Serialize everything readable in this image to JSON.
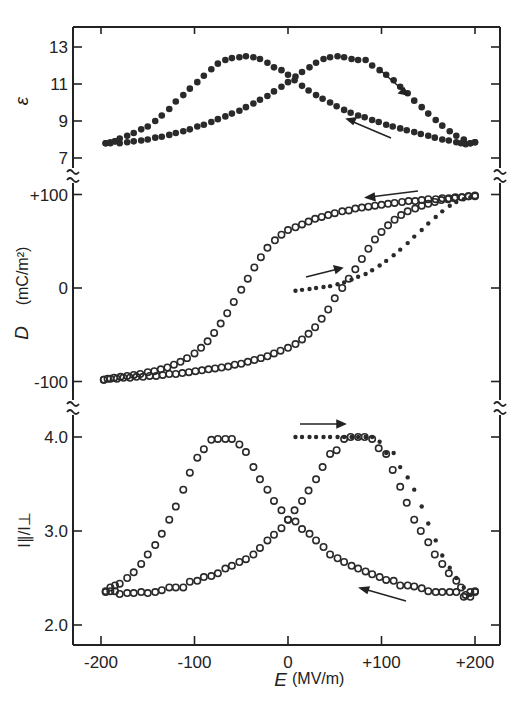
{
  "chart_data": [
    {
      "type": "scatter",
      "panel": "top",
      "title": "",
      "xlabel": "E (MV/m)",
      "ylabel": "ε",
      "xlim": [
        -200,
        200
      ],
      "ylim": [
        7,
        13
      ],
      "yticks": [
        "13",
        "11",
        "9",
        "7"
      ],
      "ytick_values": [
        13,
        11,
        9,
        7
      ],
      "marker": "filled",
      "series": [
        {
          "name": "increasing field (→)",
          "x": [
            -195,
            -190,
            -185,
            -180,
            -172,
            -165,
            -157,
            -150,
            -142,
            -135,
            -127,
            -120,
            -112,
            -105,
            -97,
            -90,
            -82,
            -75,
            -67,
            -60,
            -52,
            -45,
            -37,
            -30,
            -22,
            -15,
            -7,
            0,
            8,
            15,
            23,
            30,
            38,
            45,
            53,
            60,
            68,
            75,
            83,
            90,
            98,
            105,
            113,
            120,
            128,
            135,
            143,
            150,
            158,
            165,
            173,
            180,
            188,
            195,
            200
          ],
          "y": [
            7.8,
            7.8,
            7.9,
            7.8,
            7.85,
            7.9,
            7.95,
            8.0,
            8.1,
            8.15,
            8.25,
            8.35,
            8.45,
            8.55,
            8.7,
            8.8,
            8.95,
            9.1,
            9.25,
            9.4,
            9.55,
            9.75,
            9.95,
            10.15,
            10.35,
            10.6,
            10.85,
            11.1,
            11.4,
            11.65,
            11.9,
            12.15,
            12.35,
            12.45,
            12.5,
            12.45,
            12.35,
            12.3,
            12.3,
            12.0,
            11.75,
            11.5,
            11.2,
            10.85,
            10.5,
            10.1,
            9.75,
            9.4,
            9.05,
            8.75,
            8.45,
            8.2,
            8.0,
            7.8,
            7.85
          ]
        },
        {
          "name": "decreasing field (←)",
          "x": [
            200,
            195,
            190,
            185,
            180,
            172,
            165,
            157,
            150,
            142,
            135,
            127,
            120,
            112,
            105,
            97,
            90,
            82,
            75,
            67,
            60,
            52,
            45,
            37,
            30,
            22,
            15,
            7,
            0,
            -7,
            -15,
            -22,
            -30,
            -37,
            -45,
            -52,
            -60,
            -67,
            -75,
            -82,
            -90,
            -97,
            -105,
            -112,
            -120,
            -127,
            -135,
            -142,
            -150,
            -157,
            -165,
            -172,
            -180,
            -185,
            -190,
            -195
          ],
          "y": [
            7.85,
            7.8,
            7.75,
            7.8,
            7.85,
            7.95,
            8.0,
            8.1,
            8.2,
            8.3,
            8.4,
            8.5,
            8.6,
            8.7,
            8.8,
            8.95,
            9.05,
            9.2,
            9.3,
            9.45,
            9.6,
            9.8,
            10.0,
            10.2,
            10.4,
            10.65,
            10.9,
            11.2,
            11.5,
            11.75,
            11.9,
            12.15,
            12.35,
            12.45,
            12.5,
            12.45,
            12.4,
            12.3,
            12.1,
            11.8,
            11.45,
            11.1,
            10.75,
            10.4,
            10.05,
            9.65,
            9.3,
            9.0,
            8.7,
            8.55,
            8.35,
            8.2,
            8.05,
            7.9,
            7.85,
            7.8
          ]
        }
      ],
      "annotations": [
        "arrow → on right descending branch",
        "arrow ← on lower right branch"
      ]
    },
    {
      "type": "scatter",
      "panel": "middle",
      "title": "",
      "xlabel": "E (MV/m)",
      "ylabel": "D (mC/m²)",
      "xlim": [
        -200,
        200
      ],
      "ylim": [
        -100,
        100
      ],
      "yticks": [
        "+100",
        "0",
        "-100"
      ],
      "ytick_values": [
        100,
        0,
        -100
      ],
      "series": [
        {
          "name": "initial poling (dots)",
          "marker": "dot",
          "x": [
            8,
            15,
            23,
            30,
            38,
            45,
            53,
            60,
            68,
            75,
            83,
            90,
            98,
            105,
            113,
            120,
            128,
            135,
            143,
            150,
            158,
            165,
            173,
            180,
            188,
            195
          ],
          "y": [
            -3,
            -2,
            -1,
            0,
            1,
            2,
            4,
            6,
            9,
            12,
            15,
            19,
            24,
            29,
            35,
            41,
            48,
            55,
            62,
            69,
            76,
            82,
            88,
            92,
            95,
            97
          ]
        },
        {
          "name": "decreasing field (←)",
          "marker": "open",
          "x": [
            200,
            193,
            186,
            179,
            172,
            165,
            158,
            150,
            143,
            136,
            129,
            122,
            114,
            107,
            100,
            93,
            86,
            79,
            72,
            65,
            58,
            50,
            43,
            36,
            29,
            22,
            15,
            8,
            0,
            -7,
            -14,
            -22,
            -29,
            -36,
            -43,
            -50,
            -58,
            -65,
            -72,
            -79,
            -86,
            -93,
            -100,
            -108,
            -115,
            -122,
            -129,
            -136,
            -143,
            -150,
            -158,
            -165,
            -172,
            -179,
            -186,
            -193,
            -197
          ],
          "y": [
            98,
            98,
            97,
            97,
            96,
            96,
            95,
            95,
            94,
            93,
            93,
            92,
            91,
            90,
            89,
            88,
            87,
            86,
            85,
            83,
            82,
            80,
            78,
            76,
            74,
            71,
            68,
            65,
            62,
            57,
            51,
            43,
            33,
            22,
            10,
            -2,
            -15,
            -27,
            -38,
            -48,
            -57,
            -64,
            -70,
            -75,
            -79,
            -82,
            -85,
            -87,
            -89,
            -90,
            -92,
            -93,
            -94,
            -95,
            -96,
            -97,
            -98
          ]
        },
        {
          "name": "increasing field (→)",
          "marker": "open",
          "x": [
            -197,
            -190,
            -183,
            -176,
            -169,
            -162,
            -155,
            -148,
            -141,
            -134,
            -127,
            -120,
            -113,
            -106,
            -99,
            -92,
            -85,
            -78,
            -71,
            -64,
            -57,
            -50,
            -43,
            -36,
            -29,
            -22,
            -15,
            -8,
            0,
            8,
            15,
            22,
            29,
            36,
            43,
            50,
            58,
            65,
            72,
            79,
            86,
            93,
            100,
            107,
            114,
            121,
            128,
            136,
            143,
            150,
            157,
            164,
            171,
            178,
            186,
            193,
            200
          ],
          "y": [
            -98,
            -97,
            -97,
            -96,
            -96,
            -95,
            -95,
            -94,
            -94,
            -93,
            -92,
            -92,
            -91,
            -90,
            -89,
            -88,
            -87,
            -86,
            -85,
            -84,
            -82,
            -81,
            -79,
            -77,
            -75,
            -73,
            -70,
            -67,
            -64,
            -60,
            -55,
            -49,
            -42,
            -33,
            -23,
            -11,
            0,
            10,
            20,
            31,
            42,
            52,
            60,
            67,
            73,
            78,
            82,
            85,
            88,
            90,
            92,
            94,
            95,
            96,
            97,
            98,
            99
          ]
        }
      ],
      "annotations": [
        "arrow ← top branch",
        "arrow → near initial dotted curve"
      ]
    },
    {
      "type": "scatter",
      "panel": "bottom",
      "title": "",
      "xlabel": "E (MV/m)",
      "ylabel": "I∥/I⊥",
      "xlim": [
        -200,
        200
      ],
      "ylim": [
        2.0,
        4.0
      ],
      "xticks": [
        "-200",
        "-100",
        "0",
        "+100",
        "+200"
      ],
      "xtick_values": [
        -200,
        -100,
        0,
        100,
        200
      ],
      "yticks": [
        "4.0",
        "3.0",
        "2.0"
      ],
      "ytick_values": [
        4.0,
        3.0,
        2.0
      ],
      "series": [
        {
          "name": "initial (dots)",
          "marker": "dot",
          "x": [
            8,
            15,
            23,
            30,
            38,
            45,
            53,
            60,
            68,
            75,
            83,
            90,
            98,
            105,
            113,
            120,
            128,
            135,
            143,
            150,
            158,
            165,
            173,
            180,
            188,
            195
          ],
          "y": [
            4.0,
            4.0,
            4.0,
            4.0,
            4.0,
            4.0,
            4.0,
            4.0,
            4.0,
            4.0,
            4.0,
            4.0,
            3.95,
            3.83,
            3.83,
            3.68,
            3.57,
            3.44,
            3.26,
            3.08,
            2.9,
            2.74,
            2.61,
            2.5,
            2.4,
            2.32
          ]
        },
        {
          "name": "decreasing field (←)",
          "marker": "open",
          "x": [
            200,
            195,
            190,
            185,
            180,
            172,
            165,
            157,
            150,
            142,
            135,
            127,
            120,
            112,
            105,
            97,
            90,
            82,
            75,
            67,
            60,
            52,
            45,
            37,
            30,
            22,
            15,
            7,
            0,
            -7,
            -15,
            -22,
            -30,
            -37,
            -45,
            -52,
            -60,
            -67,
            -75,
            -82,
            -90,
            -97,
            -105,
            -112,
            -120,
            -127,
            -135,
            -142,
            -150,
            -157,
            -165,
            -172,
            -180,
            -185,
            -190,
            -195
          ],
          "y": [
            2.35,
            2.3,
            2.32,
            2.4,
            2.47,
            2.55,
            2.65,
            2.75,
            2.88,
            3.0,
            3.12,
            3.3,
            3.47,
            3.65,
            3.82,
            3.88,
            3.98,
            4.0,
            4.0,
            4.0,
            3.98,
            3.86,
            3.82,
            3.68,
            3.55,
            3.43,
            3.32,
            3.22,
            3.12,
            3.03,
            2.96,
            2.9,
            2.82,
            2.75,
            2.7,
            2.67,
            2.63,
            2.6,
            2.55,
            2.52,
            2.51,
            2.47,
            2.46,
            2.4,
            2.4,
            2.4,
            2.37,
            2.35,
            2.34,
            2.35,
            2.34,
            2.34,
            2.33,
            2.36,
            2.36,
            2.35
          ]
        },
        {
          "name": "increasing field (→)",
          "marker": "open",
          "x": [
            -195,
            -190,
            -185,
            -180,
            -172,
            -165,
            -157,
            -150,
            -142,
            -135,
            -127,
            -120,
            -112,
            -105,
            -97,
            -90,
            -82,
            -75,
            -67,
            -60,
            -52,
            -45,
            -37,
            -30,
            -22,
            -15,
            -7,
            0,
            8,
            15,
            23,
            30,
            38,
            45,
            53,
            60,
            68,
            75,
            83,
            90,
            98,
            105,
            113,
            120,
            128,
            135,
            143,
            150,
            158,
            165,
            173,
            180,
            188,
            195,
            200
          ],
          "y": [
            2.36,
            2.4,
            2.42,
            2.44,
            2.5,
            2.56,
            2.65,
            2.75,
            2.85,
            2.97,
            3.12,
            3.26,
            3.44,
            3.62,
            3.78,
            3.87,
            3.97,
            3.98,
            3.98,
            3.98,
            3.92,
            3.84,
            3.68,
            3.55,
            3.44,
            3.32,
            3.22,
            3.12,
            3.1,
            3.02,
            2.97,
            2.9,
            2.83,
            2.75,
            2.71,
            2.67,
            2.63,
            2.6,
            2.57,
            2.54,
            2.51,
            2.48,
            2.47,
            2.42,
            2.42,
            2.41,
            2.39,
            2.36,
            2.35,
            2.35,
            2.35,
            2.35,
            2.3,
            2.35,
            2.36
          ]
        }
      ],
      "annotations": [
        "arrow → above dotted plateau",
        "arrow ← on lower right branch"
      ]
    }
  ],
  "axes": {
    "x_ticks": [
      "-200",
      "-100",
      "0",
      "+100",
      "+200"
    ],
    "x_label_symbol": "E",
    "x_label_unit": "(MV/m)",
    "top": {
      "y_label": "ε",
      "ticks": [
        "13",
        "11",
        "9",
        "7"
      ]
    },
    "middle": {
      "y_label_symbol": "D",
      "y_label_unit": "(mC/m²)",
      "ticks": [
        "+100",
        "0",
        "-100"
      ]
    },
    "bottom": {
      "y_label": "I∥/I⊥",
      "ticks": [
        "4.0",
        "3.0",
        "2.0"
      ]
    }
  },
  "colors": {
    "ink": "#222222",
    "background": "#ffffff"
  }
}
